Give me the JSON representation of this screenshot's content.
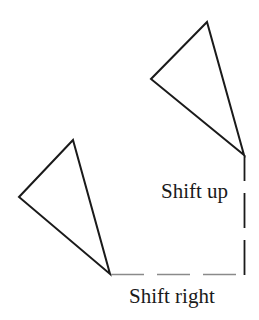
{
  "diagram": {
    "type": "translation-illustration",
    "colors": {
      "shape_stroke": "#1a1a1a",
      "horizontal_guide": "#8a8a8a",
      "vertical_guide": "#1a1a1a",
      "text": "#1a1a1a",
      "background": "#ffffff"
    },
    "shapes": [
      {
        "id": "original-triangle",
        "label": "",
        "vertices": [
          [
            73,
            140
          ],
          [
            19,
            197
          ],
          [
            110,
            274
          ]
        ]
      },
      {
        "id": "translated-triangle",
        "label": "",
        "vertices": [
          [
            207,
            22
          ],
          [
            151,
            79
          ],
          [
            244,
            155
          ]
        ]
      }
    ],
    "guides": [
      {
        "id": "shift-right-path",
        "from": [
          110,
          274
        ],
        "to": [
          244,
          274
        ],
        "style": "dashed"
      },
      {
        "id": "shift-up-path",
        "from": [
          244,
          274
        ],
        "to": [
          244,
          155
        ],
        "style": "dashed"
      }
    ],
    "labels": {
      "shift_up": "Shift up",
      "shift_right": "Shift right"
    }
  }
}
